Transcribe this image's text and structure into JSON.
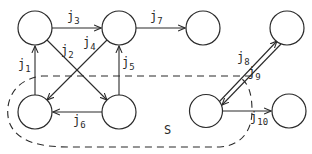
{
  "diagram": {
    "type": "directed-graph",
    "colors": {
      "stroke": "#2a2a2a",
      "background": "#ffffff"
    },
    "nodes": [
      {
        "id": "tl",
        "cx": 35,
        "cy": 28
      },
      {
        "id": "tm",
        "cx": 119,
        "cy": 28
      },
      {
        "id": "tr1",
        "cx": 203,
        "cy": 28
      },
      {
        "id": "tr2",
        "cx": 287,
        "cy": 28
      },
      {
        "id": "bl",
        "cx": 35,
        "cy": 112
      },
      {
        "id": "bm",
        "cx": 119,
        "cy": 112
      },
      {
        "id": "br1",
        "cx": 206,
        "cy": 111
      },
      {
        "id": "br2",
        "cx": 289,
        "cy": 111
      }
    ],
    "edges": [
      {
        "id": "j1",
        "base": "j",
        "sub": "1",
        "from": "bl",
        "to": "tl"
      },
      {
        "id": "j2",
        "base": "j",
        "sub": "2",
        "from": "tl",
        "to": "bm"
      },
      {
        "id": "j3",
        "base": "j",
        "sub": "3",
        "from": "tl",
        "to": "tm"
      },
      {
        "id": "j4",
        "base": "j",
        "sub": "4",
        "from": "tm",
        "to": "bl"
      },
      {
        "id": "j5",
        "base": "j",
        "sub": "5",
        "from": "bm",
        "to": "tm"
      },
      {
        "id": "j6",
        "base": "j",
        "sub": "6",
        "from": "bm",
        "to": "bl"
      },
      {
        "id": "j7",
        "base": "j",
        "sub": "7",
        "from": "tm",
        "to": "tr1"
      },
      {
        "id": "j8",
        "base": "j",
        "sub": "8",
        "from": "br1",
        "to": "tr2"
      },
      {
        "id": "j9",
        "base": "j",
        "sub": "9",
        "from": "tr2",
        "to": "br1"
      },
      {
        "id": "j10",
        "base": "j",
        "sub": "10",
        "from": "br1",
        "to": "br2"
      }
    ],
    "set": {
      "label": "S",
      "members": [
        "bl",
        "bm",
        "br1"
      ],
      "style": "dashed"
    }
  }
}
